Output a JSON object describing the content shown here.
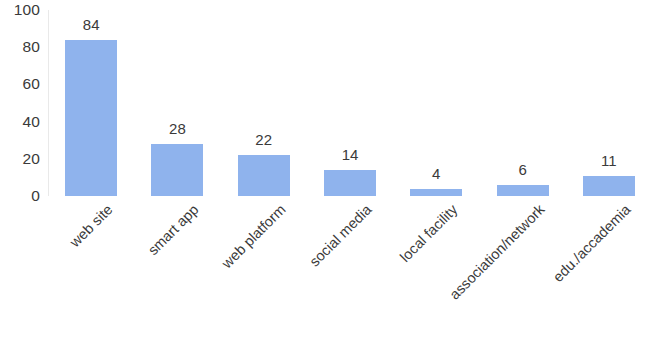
{
  "chart_data": {
    "type": "bar",
    "title": "",
    "subtitle": "",
    "xlabel": "",
    "ylabel": "",
    "categories": [
      "web site",
      "smart app",
      "web platform",
      "social media",
      "local facility",
      "association/network",
      "edu./accademia"
    ],
    "values": [
      84,
      28,
      22,
      14,
      4,
      6,
      11
    ],
    "data_labels": [
      "84",
      "28",
      "22",
      "14",
      "4",
      "6",
      "11"
    ],
    "ylim": [
      0,
      100
    ],
    "y_ticks": [
      100,
      80,
      60,
      40,
      20,
      0
    ],
    "y_tick_labels": [
      "100",
      "80",
      "60",
      "40",
      "20",
      "0"
    ],
    "grid": false,
    "legend": false,
    "legend_position": "none",
    "x_tick_label_rotation_deg": -45,
    "bar_color": "#8fb3ed",
    "text_color": "#3a3a3a",
    "background_color": "#ffffff",
    "axis_line_color": "#e9e9e9"
  }
}
